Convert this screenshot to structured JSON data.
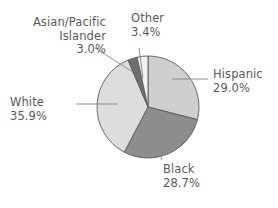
{
  "chart_data": {
    "type": "pie",
    "title": "",
    "categories": [
      "Hispanic",
      "Black",
      "White",
      "Asian/Pacific Islander",
      "Other"
    ],
    "values": [
      29.0,
      28.7,
      35.9,
      3.0,
      3.4
    ],
    "value_suffix": "%",
    "start_angle_deg": 0,
    "direction": "clockwise",
    "legend": "none",
    "labels_position": "outside-with-leader-lines",
    "slice_colors": [
      "#cfcfcf",
      "#8d8d8d",
      "#dddddd",
      "#6e6e6e",
      "#f2f2f2"
    ],
    "slice_outline_color": "#5a5a5a",
    "leader_line_color": "#8c8c8c",
    "label_text_color": "#5a5a5a",
    "background_color": "#ffffff"
  },
  "slices": {
    "hispanic": {
      "name": "Hispanic",
      "pct": "29.0%",
      "color": "#cfcfcf"
    },
    "black": {
      "name": "Black",
      "pct": "28.7%",
      "color": "#8d8d8d"
    },
    "white": {
      "name": "White",
      "pct": "35.9%",
      "color": "#dddddd"
    },
    "asian_pacific_islander": {
      "name_line1": "Asian/Pacific",
      "name_line2": "Islander",
      "pct": "3.0%",
      "color": "#6e6e6e"
    },
    "other": {
      "name": "Other",
      "pct": "3.4%",
      "color": "#f2f2f2"
    }
  }
}
